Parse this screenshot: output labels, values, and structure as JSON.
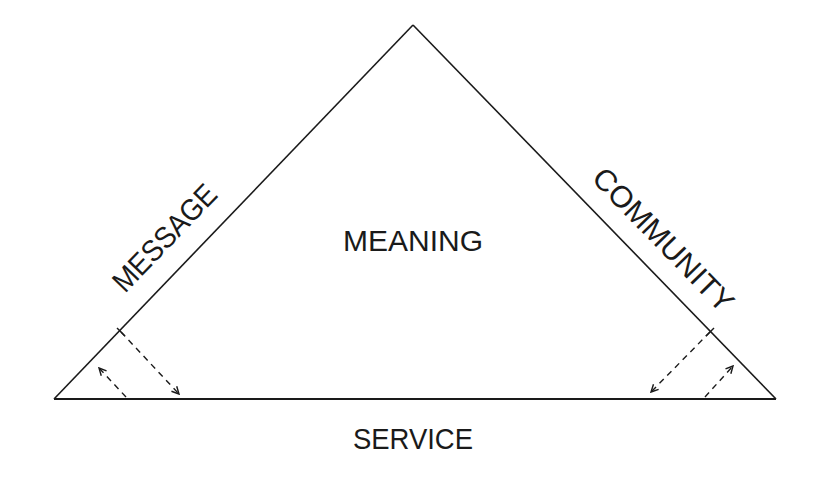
{
  "diagram": {
    "type": "triangle",
    "stroke_color": "#1a1a1a",
    "background": "#ffffff",
    "vertices": {
      "apex": [
        413,
        25
      ],
      "bottom_left": [
        54,
        399
      ],
      "bottom_right": [
        776,
        399
      ]
    },
    "labels": {
      "center": "MEANING",
      "left_side": "MESSAGE",
      "right_side": "COMMUNITY",
      "base": "SERVICE"
    },
    "connectors": [
      {
        "side": "left",
        "style": "dashed",
        "from": [
          121,
          332
        ],
        "to": [
          179,
          394
        ],
        "direction": "side-to-base"
      },
      {
        "side": "left",
        "style": "dashed",
        "from": [
          126,
          397
        ],
        "to": [
          99,
          368
        ],
        "direction": "base-to-side"
      },
      {
        "side": "right",
        "style": "dashed",
        "from": [
          710,
          332
        ],
        "to": [
          651,
          392
        ],
        "direction": "side-to-base"
      },
      {
        "side": "right",
        "style": "dashed",
        "from": [
          705,
          397
        ],
        "to": [
          733,
          366
        ],
        "direction": "base-to-side"
      }
    ]
  }
}
